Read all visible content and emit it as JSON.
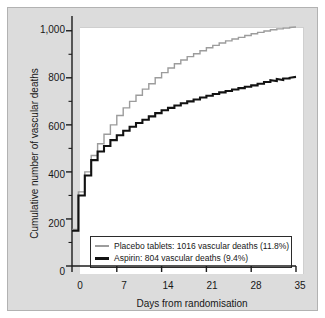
{
  "chart_data": {
    "type": "line",
    "subtype": "step",
    "title": "",
    "xlabel": "Days from randomisation",
    "ylabel": "Cumulative number of vascular deaths",
    "xlim": [
      0,
      35
    ],
    "ylim": [
      0,
      1050
    ],
    "grid": false,
    "legend_position": "lower-left-inside",
    "xticks": [
      0,
      7,
      14,
      21,
      28,
      35
    ],
    "xtick_labels": [
      "0",
      "7",
      "14",
      "21",
      "28",
      "35"
    ],
    "yticks": [
      0,
      200,
      400,
      600,
      800,
      1000
    ],
    "ytick_labels": [
      "0",
      "200",
      "400",
      "600",
      "800",
      "1,000"
    ],
    "yticks_minor": [
      100,
      300,
      500,
      700,
      900
    ],
    "series": [
      {
        "name": "Placebo tablets",
        "label": "Placebo tablets: 1016 vascular deaths (11.8%)",
        "color": "#9c9c9c",
        "total_deaths": 1016,
        "percent": "11.8%",
        "x": [
          0,
          1,
          1,
          2,
          2,
          3,
          3,
          4,
          4,
          5,
          5,
          6,
          6,
          7,
          7,
          8,
          8,
          9,
          9,
          10,
          10,
          11,
          11,
          12,
          12,
          13,
          13,
          14,
          14,
          15,
          15,
          16,
          16,
          17,
          17,
          18,
          18,
          19,
          19,
          20,
          20,
          21,
          21,
          22,
          22,
          23,
          23,
          24,
          24,
          25,
          25,
          26,
          26,
          27,
          27,
          28,
          28,
          29,
          29,
          30,
          30,
          31,
          31,
          32,
          32,
          33,
          33,
          34,
          34,
          35
        ],
        "y": [
          155,
          155,
          315,
          315,
          400,
          400,
          470,
          470,
          520,
          520,
          560,
          560,
          600,
          600,
          640,
          640,
          672,
          672,
          700,
          700,
          726,
          726,
          752,
          752,
          775,
          775,
          800,
          800,
          822,
          822,
          842,
          842,
          860,
          860,
          876,
          876,
          890,
          890,
          902,
          902,
          915,
          915,
          928,
          928,
          938,
          938,
          948,
          948,
          957,
          957,
          965,
          965,
          972,
          972,
          980,
          980,
          987,
          987,
          993,
          993,
          999,
          999,
          1004,
          1004,
          1008,
          1008,
          1011,
          1011,
          1014,
          1016
        ]
      },
      {
        "name": "Aspirin",
        "label": "Aspirin: 804 vascular deaths (9.4%)",
        "color": "#121212",
        "total_deaths": 804,
        "percent": "9.4%",
        "x": [
          0,
          1,
          1,
          2,
          2,
          3,
          3,
          4,
          4,
          5,
          5,
          6,
          6,
          7,
          7,
          8,
          8,
          9,
          9,
          10,
          10,
          11,
          11,
          12,
          12,
          13,
          13,
          14,
          14,
          15,
          15,
          16,
          16,
          17,
          17,
          18,
          18,
          19,
          19,
          20,
          20,
          21,
          21,
          22,
          22,
          23,
          23,
          24,
          24,
          25,
          25,
          26,
          26,
          27,
          27,
          28,
          28,
          29,
          29,
          30,
          30,
          31,
          31,
          32,
          32,
          33,
          33,
          34,
          34,
          35
        ],
        "y": [
          150,
          150,
          300,
          300,
          385,
          385,
          450,
          450,
          487,
          487,
          510,
          510,
          535,
          535,
          556,
          556,
          575,
          575,
          592,
          592,
          608,
          608,
          622,
          622,
          636,
          636,
          650,
          650,
          662,
          662,
          672,
          672,
          682,
          682,
          692,
          692,
          700,
          700,
          708,
          708,
          716,
          716,
          724,
          724,
          731,
          731,
          738,
          738,
          744,
          744,
          750,
          750,
          756,
          756,
          762,
          762,
          768,
          768,
          775,
          775,
          782,
          782,
          790,
          786,
          795,
          791,
          797,
          797,
          800,
          804
        ]
      }
    ]
  },
  "legend": {
    "placebo": "Placebo tablets: 1016 vascular deaths (11.8%)",
    "aspirin": "Aspirin: 804 vascular deaths (9.4%)"
  },
  "axes": {
    "x_title": "Days from randomisation",
    "y_title": "Cumulative number of vascular deaths"
  }
}
